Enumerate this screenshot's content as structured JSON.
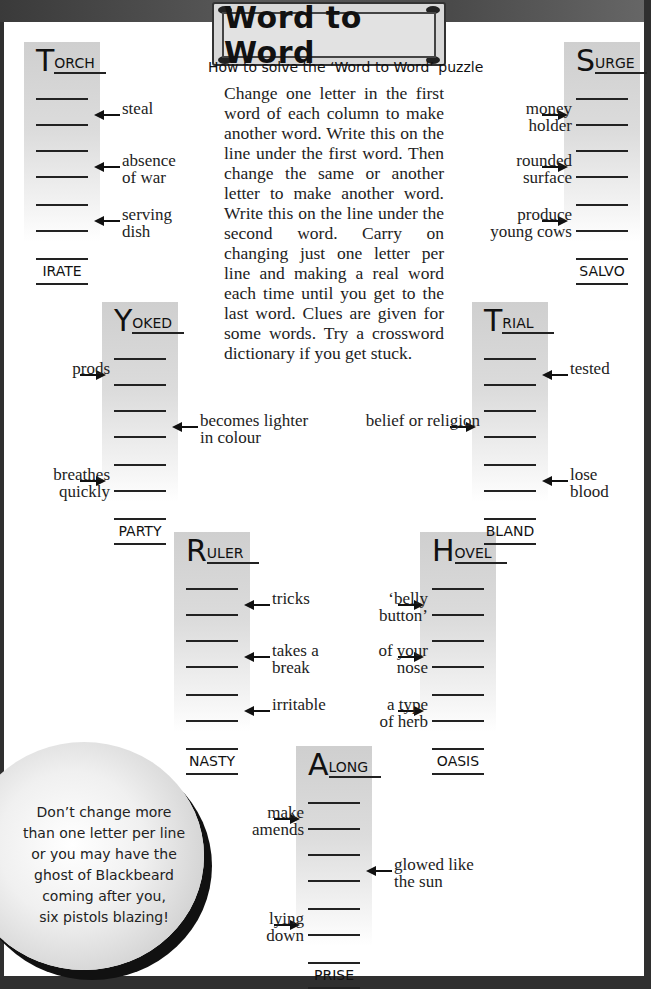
{
  "title": "Word to Word",
  "howto_heading": "How to solve the ‘Word to Word’ puzzle",
  "instructions": "Change one letter in the first word of each column to make another word. Write this on the line under the first word. Then change the same or another letter to make another word. Write this on the line under the second word. Carry on changing just one letter per line and making a real word each time until you get to the last word. Clues are given for some words. Try a crossword dictionary if you get stuck.",
  "puzzles": [
    {
      "id": "torch",
      "first_initial": "T",
      "first_rest": "ORCH",
      "last": "IRATE",
      "clues": [
        "steal",
        "absence of war",
        "serving dish"
      ]
    },
    {
      "id": "surge",
      "first_initial": "S",
      "first_rest": "URGE",
      "last": "SALVO",
      "clues": [
        "money holder",
        "rounded surface",
        "produce young cows"
      ]
    },
    {
      "id": "yoked",
      "first_initial": "Y",
      "first_rest": "OKED",
      "last": "PARTY",
      "clues": [
        "prods",
        "becomes lighter in colour",
        "breathes quickly"
      ]
    },
    {
      "id": "trial",
      "first_initial": "T",
      "first_rest": "RIAL",
      "last": "BLAND",
      "clues": [
        "tested",
        "belief or religion",
        "lose blood"
      ]
    },
    {
      "id": "ruler",
      "first_initial": "R",
      "first_rest": "ULER",
      "last": "NASTY",
      "clues": [
        "tricks",
        "takes a break",
        "irritable"
      ]
    },
    {
      "id": "hovel",
      "first_initial": "H",
      "first_rest": "OVEL",
      "last": "OASIS",
      "clues": [
        "‘belly button’",
        "of your nose",
        "a type of herb"
      ]
    },
    {
      "id": "along",
      "first_initial": "A",
      "first_rest": "LONG",
      "last": "PRISE",
      "clues": [
        "make amends",
        "glowed like the sun",
        "lying down"
      ]
    }
  ],
  "clue_lines": {
    "torch": [
      [
        "steal"
      ],
      [
        "absence",
        "of war"
      ],
      [
        "serving",
        "dish"
      ]
    ],
    "surge": [
      [
        "money",
        "holder"
      ],
      [
        "rounded",
        "surface"
      ],
      [
        "produce",
        "young cows"
      ]
    ],
    "yoked": [
      [
        "prods"
      ],
      [
        "becomes lighter",
        "in colour"
      ],
      [
        "breathes",
        "quickly"
      ]
    ],
    "trial": [
      [
        "tested"
      ],
      [
        "belief or religion"
      ],
      [
        "lose",
        "blood"
      ]
    ],
    "ruler": [
      [
        "tricks"
      ],
      [
        "takes a",
        "break"
      ],
      [
        "irritable"
      ]
    ],
    "hovel": [
      [
        "‘belly",
        "button’"
      ],
      [
        "of your",
        "nose"
      ],
      [
        "a type",
        "of herb"
      ]
    ],
    "along": [
      [
        "make",
        "amends"
      ],
      [
        "glowed like",
        "the sun"
      ],
      [
        "lying",
        "down"
      ]
    ]
  },
  "tip_bubble": [
    "Don’t change more",
    "than one letter per line",
    "or you may have the",
    "ghost of Blackbeard",
    "coming after you,",
    "six pistols blazing!"
  ],
  "colors": {
    "ink": "#111111",
    "column_shade": "#cfcfcf",
    "frame": "#2f2f2f",
    "paper": "#ffffff"
  }
}
